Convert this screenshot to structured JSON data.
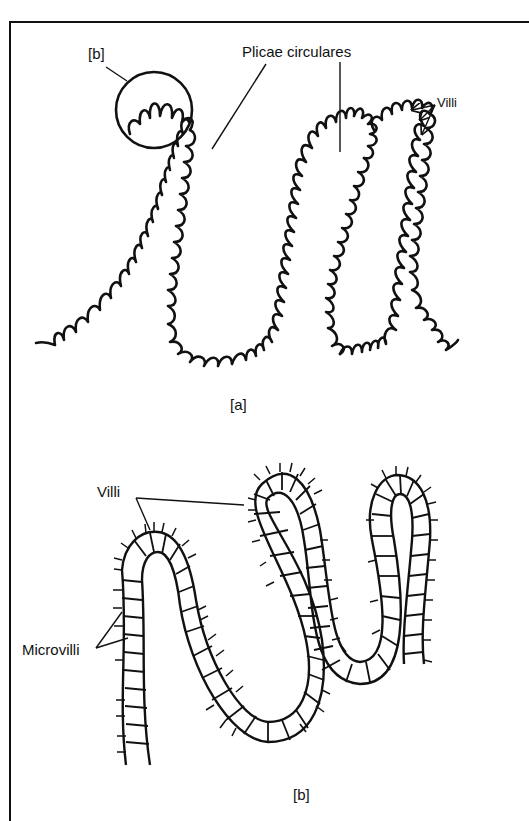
{
  "figure": {
    "panel_a": {
      "caption": "[a]",
      "labels": {
        "inset_ref": "[b]",
        "plicae": "Plicae circulares",
        "villi": "Villi"
      }
    },
    "panel_b": {
      "caption": "[b]",
      "labels": {
        "villi": "Villi",
        "microvilli": "Microvilli"
      }
    }
  },
  "colors": {
    "ink": "#111111",
    "background": "#ffffff"
  }
}
